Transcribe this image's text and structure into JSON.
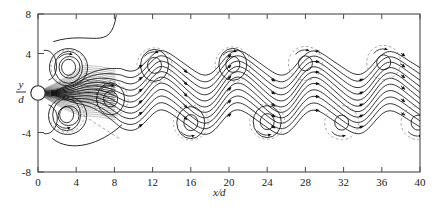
{
  "chart_data": {
    "type": "line",
    "title": "",
    "subtitle": "",
    "xlabel": "x/d",
    "ylabel": "y/d",
    "xlabel_parts": {
      "num": "x",
      "den": "d"
    },
    "ylabel_parts": {
      "num": "y",
      "den": "d"
    },
    "xlim": [
      0,
      40
    ],
    "ylim": [
      -8,
      8
    ],
    "xticks": [
      0,
      4,
      8,
      12,
      16,
      20,
      24,
      28,
      32,
      36,
      40
    ],
    "xticklabels": [
      "0",
      "4",
      "8",
      "12",
      "16",
      "20",
      "24",
      "28",
      "32",
      "36",
      "40"
    ],
    "yticks": [
      -8,
      -4,
      0,
      4,
      8
    ],
    "yticklabels": [
      "-8",
      "-4",
      "",
      "4",
      "8"
    ],
    "grid": false,
    "legend": null,
    "frame": "box",
    "marker_origin": {
      "x": 0,
      "y": 0,
      "shape": "open-circle",
      "label": "cylinder"
    },
    "series": [
      {
        "name": "streamlines",
        "style": "solid",
        "color": "#111111",
        "count": 11,
        "arrowheads": true
      },
      {
        "name": "vortex-core-loops",
        "style": "solid-closed",
        "color": "#111111"
      },
      {
        "name": "vortex-core-dashed",
        "style": "dashed-circle",
        "color": "#8a8a8a"
      }
    ],
    "streamlines": [
      {
        "id": "sl-1",
        "y0": 3.05,
        "amp": 1.2,
        "phase": 0.0
      },
      {
        "id": "sl-2",
        "y0": 2.45,
        "amp": 1.28,
        "phase": 0.0
      },
      {
        "id": "sl-3",
        "y0": 1.85,
        "amp": 1.34,
        "phase": 0.0
      },
      {
        "id": "sl-4",
        "y0": 1.25,
        "amp": 1.4,
        "phase": 0.0
      },
      {
        "id": "sl-5",
        "y0": 0.68,
        "amp": 1.45,
        "phase": 0.0
      },
      {
        "id": "sl-6",
        "y0": 0.1,
        "amp": 1.48,
        "phase": 0.0
      },
      {
        "id": "sl-7",
        "y0": -0.48,
        "amp": 1.45,
        "phase": 0.0
      },
      {
        "id": "sl-8",
        "y0": -1.08,
        "amp": 1.4,
        "phase": 0.0
      },
      {
        "id": "sl-9",
        "y0": -1.68,
        "amp": 1.34,
        "phase": 0.0
      },
      {
        "id": "sl-10",
        "y0": -2.3,
        "amp": 1.28,
        "phase": 0.0
      },
      {
        "id": "sl-11",
        "y0": -2.95,
        "amp": 1.2,
        "phase": 0.0
      }
    ],
    "vortex_centers": [
      {
        "x": 3.2,
        "y": 2.6,
        "sense": "cw",
        "type": "solid"
      },
      {
        "x": 3.0,
        "y": -2.2,
        "sense": "ccw",
        "type": "solid"
      },
      {
        "x": 7.6,
        "y": -0.6,
        "sense": "cw",
        "type": "solid"
      },
      {
        "x": 12.2,
        "y": 2.8,
        "sense": "cw",
        "type": "solid"
      },
      {
        "x": 16.0,
        "y": -3.0,
        "sense": "ccw",
        "type": "solid"
      },
      {
        "x": 20.4,
        "y": 2.9,
        "sense": "cw",
        "type": "solid"
      },
      {
        "x": 24.0,
        "y": -2.9,
        "sense": "ccw",
        "type": "solid"
      },
      {
        "x": 28.0,
        "y": 3.0,
        "sense": "cw",
        "type": "dashed"
      },
      {
        "x": 31.8,
        "y": -3.0,
        "sense": "ccw",
        "type": "dashed"
      },
      {
        "x": 36.2,
        "y": 3.1,
        "sense": "cw",
        "type": "dashed"
      },
      {
        "x": 39.8,
        "y": -3.0,
        "sense": "ccw",
        "type": "dashed"
      }
    ],
    "annotations": [
      {
        "kind": "dashed-ray",
        "from": {
          "x": 8.5,
          "y": -4.6
        },
        "to": {
          "x": 3.0,
          "y": -1.2
        }
      }
    ]
  }
}
